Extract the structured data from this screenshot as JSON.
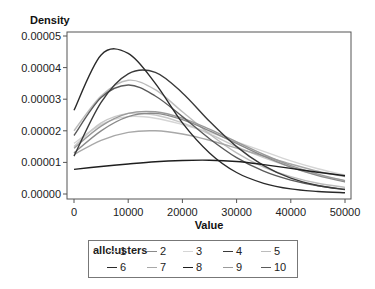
{
  "chart_data": {
    "type": "line",
    "title": "",
    "xlabel": "Value",
    "ylabel": "Density",
    "xlim": [
      0,
      50000
    ],
    "ylim": [
      0,
      5e-05
    ],
    "x_ticks": [
      "0",
      "10000",
      "20000",
      "30000",
      "40000",
      "50000"
    ],
    "y_ticks": [
      "0.00000",
      "0.00001",
      "0.00002",
      "0.00003",
      "0.00004",
      "0.00005"
    ],
    "grid": false,
    "legend_position": "bottom",
    "legend_title": "allclusters",
    "x": [
      0,
      5000,
      10000,
      15000,
      20000,
      25000,
      30000,
      35000,
      40000,
      45000,
      50000
    ],
    "series": [
      {
        "name": "1",
        "color": "#c8c8c8",
        "values": [
          1.5e-05,
          2.25e-05,
          2.55e-05,
          2.5e-05,
          2.25e-05,
          1.9e-05,
          1.5e-05,
          1.15e-05,
          8.5e-06,
          6e-06,
          4.2e-06
        ]
      },
      {
        "name": "2",
        "color": "#8a8a8a",
        "values": [
          1.3e-05,
          2e-05,
          2.45e-05,
          2.55e-05,
          2.35e-05,
          2e-05,
          1.6e-05,
          1.2e-05,
          8.5e-06,
          5.8e-06,
          3.8e-06
        ]
      },
      {
        "name": "3",
        "color": "#d5d5d5",
        "values": [
          1.6e-05,
          2.2e-05,
          2.45e-05,
          2.4e-05,
          2.2e-05,
          1.95e-05,
          1.65e-05,
          1.35e-05,
          1.05e-05,
          8e-06,
          6e-06
        ]
      },
      {
        "name": "4",
        "color": "#3a3a3a",
        "values": [
          1.2e-05,
          2.9e-05,
          3.8e-05,
          3.85e-05,
          3.2e-05,
          2.3e-05,
          1.5e-05,
          9e-06,
          5e-06,
          2.7e-06,
          1.4e-06
        ]
      },
      {
        "name": "5",
        "color": "#bcbcbc",
        "values": [
          2e-05,
          3.1e-05,
          3.6e-05,
          3.3e-05,
          2.6e-05,
          1.9e-05,
          1.3e-05,
          8.5e-06,
          5.5e-06,
          3.4e-06,
          2.1e-06
        ]
      },
      {
        "name": "6",
        "color": "#2a2a2a",
        "values": [
          2.65e-05,
          4.4e-05,
          4.45e-05,
          3.5e-05,
          2.25e-05,
          1.3e-05,
          6.8e-06,
          3.4e-06,
          1.6e-06,
          8e-07,
          4e-07
        ]
      },
      {
        "name": "7",
        "color": "#a8a8a8",
        "values": [
          1.25e-05,
          1.7e-05,
          1.95e-05,
          2e-05,
          1.9e-05,
          1.7e-05,
          1.45e-05,
          1.2e-05,
          9.5e-06,
          7.2e-06,
          5.5e-06
        ]
      },
      {
        "name": "8",
        "color": "#1e1e1e",
        "values": [
          7.8e-06,
          8.7e-06,
          9.5e-06,
          1.02e-05,
          1.06e-05,
          1.07e-05,
          1.03e-05,
          9.3e-06,
          8.1e-06,
          6.9e-06,
          5.8e-06
        ]
      },
      {
        "name": "9",
        "color": "#9a9a9a",
        "values": [
          1.45e-05,
          2.15e-05,
          2.55e-05,
          2.6e-05,
          2.4e-05,
          2.05e-05,
          1.65e-05,
          1.25e-05,
          9e-06,
          6.3e-06,
          4.2e-06
        ]
      },
      {
        "name": "10",
        "color": "#5a5a5a",
        "values": [
          1.85e-05,
          3.05e-05,
          3.45e-05,
          3.1e-05,
          2.45e-05,
          1.75e-05,
          1.15e-05,
          7.2e-06,
          4.4e-06,
          2.6e-06,
          1.5e-06
        ]
      }
    ]
  },
  "legend": {
    "title": "allclusters",
    "row1": [
      "1",
      "2",
      "3",
      "4",
      "5"
    ],
    "row2": [
      "6",
      "7",
      "8",
      "9",
      "10"
    ]
  }
}
